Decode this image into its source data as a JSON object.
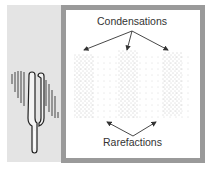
{
  "diagram": {
    "labels": {
      "condensations": "Condensations",
      "rarefactions": "Rarefactions"
    },
    "colors": {
      "left_panel_bg": "#e4e4e4",
      "frame_border": "#9a9a9a",
      "arrow": "#333333",
      "dots": "#888888"
    },
    "condensation_bands": 3,
    "rarefaction_gaps": 2
  }
}
